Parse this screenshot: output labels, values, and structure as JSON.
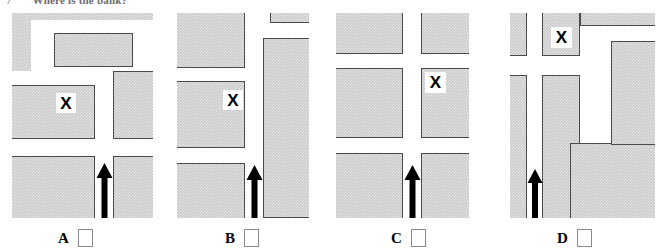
{
  "question": {
    "number": "7",
    "text": "Where is the bank?"
  },
  "figure": {
    "type": "map-diagram",
    "colors": {
      "building_fill": "#c9c9c9",
      "building_outline": "#4a4a4a",
      "street": "#ffffff",
      "arrow": "#000000",
      "checkbox_border": "#8a8a8a",
      "page_background": "#ffffff"
    },
    "marker_label": "X"
  },
  "options": [
    {
      "id": "A",
      "label": "A",
      "checkbox_checked": false,
      "marker": "X",
      "arrow": "up",
      "layout": "Large block with a rectangular inner courtyard across the top; X sits on the left-hand block beside the central street; arrow enters from the bottom on the central street."
    },
    {
      "id": "B",
      "label": "B",
      "checkbox_checked": false,
      "marker": "X",
      "arrow": "up",
      "layout": "Three stacked blocks down the left side and one tall block down the right side; X sits on the middle left block; arrow enters from the bottom on the central street."
    },
    {
      "id": "C",
      "label": "C",
      "checkbox_checked": false,
      "marker": "X",
      "arrow": "up",
      "layout": "Six blocks in a two-by-three grid separated by a cross of streets; X sits on the middle right block; arrow enters from the bottom on the central vertical street."
    },
    {
      "id": "D",
      "label": "D",
      "checkbox_checked": false,
      "marker": "X",
      "arrow": "up",
      "layout": "Narrow strip block on the left and an L-shaped block wrapping a courtyard on the right; X sits on the small upper-middle block; arrow enters from the bottom left street."
    }
  ]
}
